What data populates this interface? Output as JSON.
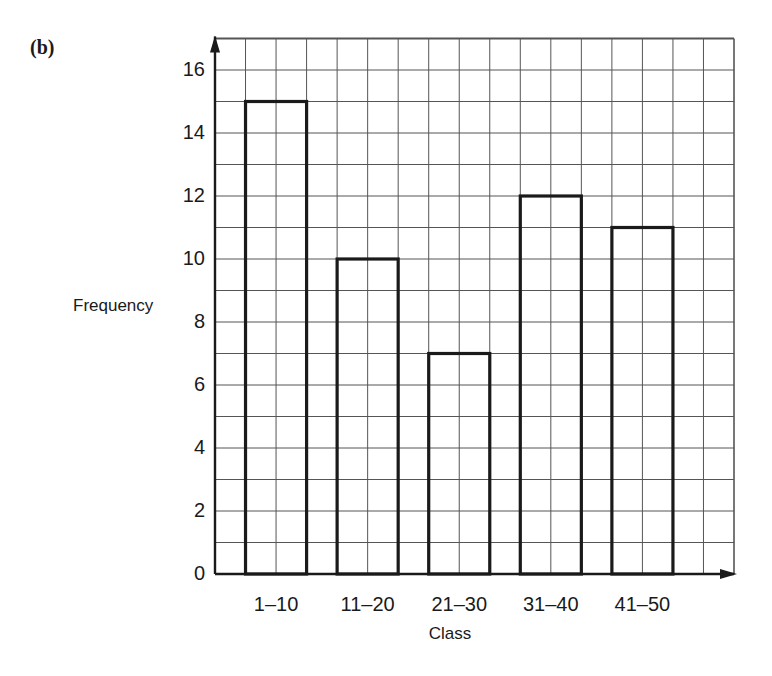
{
  "figure": {
    "panel_label": "(b)"
  },
  "chart_data": {
    "type": "bar",
    "title": "",
    "xlabel": "Class",
    "ylabel": "Frequency",
    "categories": [
      "1–10",
      "11–20",
      "21–30",
      "31–40",
      "41–50"
    ],
    "values": [
      15,
      10,
      7,
      12,
      11
    ],
    "ylim": [
      0,
      17
    ],
    "yticks": [
      0,
      2,
      4,
      6,
      8,
      10,
      12,
      14,
      16
    ],
    "grid": true,
    "bar_fill": "#ffffff",
    "bar_outline": "#1a1a1a",
    "grid_color": "#555555"
  },
  "axes": {
    "yticks": [
      "0",
      "2",
      "4",
      "6",
      "8",
      "10",
      "12",
      "14",
      "16"
    ],
    "xticks": [
      "1–10",
      "11–20",
      "21–30",
      "31–40",
      "41–50"
    ],
    "xlabel": "Class",
    "ylabel": "Frequency"
  }
}
